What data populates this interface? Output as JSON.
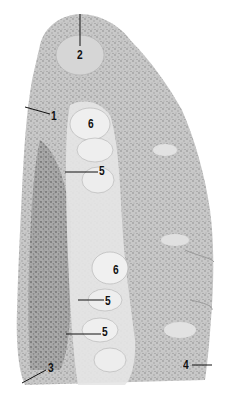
{
  "figure": {
    "type": "histology-micrograph",
    "colors": {
      "background": "#ffffff",
      "tissue_dark": "#8a8a8a",
      "tissue_mid": "#b4b4b4",
      "tissue_light": "#dcdcdc",
      "gland_pale": "#ececec",
      "label_ink": "#111111"
    },
    "labels": [
      {
        "id": "l2",
        "text": "2",
        "x": 77,
        "y": 49
      },
      {
        "id": "l1",
        "text": "1",
        "x": 51,
        "y": 110
      },
      {
        "id": "l6a",
        "text": "6",
        "x": 88,
        "y": 118
      },
      {
        "id": "l5a",
        "text": "5",
        "x": 99,
        "y": 165
      },
      {
        "id": "l6b",
        "text": "6",
        "x": 113,
        "y": 264
      },
      {
        "id": "l5b",
        "text": "5",
        "x": 105,
        "y": 295
      },
      {
        "id": "l5c",
        "text": "5",
        "x": 102,
        "y": 326
      },
      {
        "id": "l3",
        "text": "3",
        "x": 48,
        "y": 362
      },
      {
        "id": "l4",
        "text": "4",
        "x": 183,
        "y": 359
      }
    ]
  }
}
